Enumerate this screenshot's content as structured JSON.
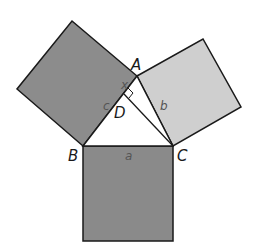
{
  "diagram": {
    "type": "Pythagorean theorem proof figure",
    "colors": {
      "square_a": "#8a8a8a",
      "square_c": "#8c8c8c",
      "square_b": "#cfcfcf",
      "stroke": "#1a1a1a",
      "triangle": "#ffffff"
    },
    "vertices": {
      "A": "A",
      "B": "B",
      "C": "C",
      "D": "D"
    },
    "sides": {
      "a": "a",
      "b": "b",
      "c": "c",
      "x": "x"
    },
    "right_angle_at": "D"
  }
}
